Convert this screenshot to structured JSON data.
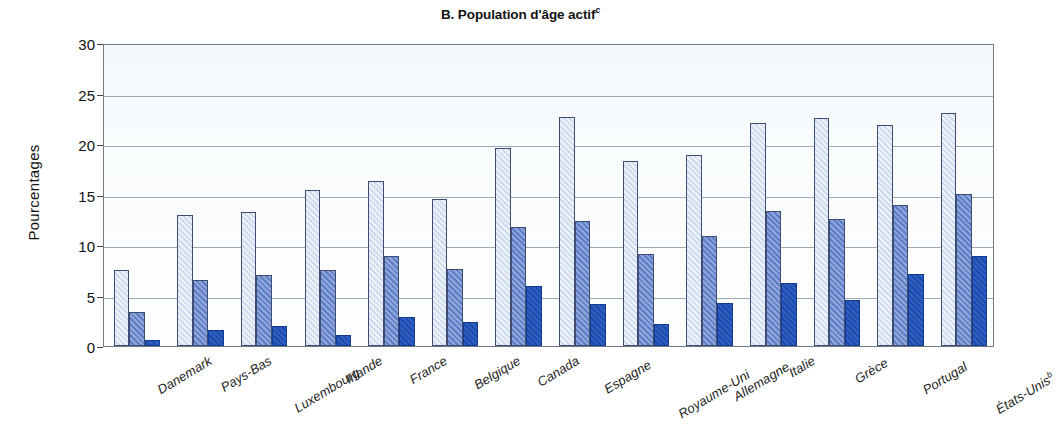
{
  "figure": {
    "panel_label": "B.",
    "title": "B. Population d'âge actif",
    "title_main": "B. Population d'âge actif",
    "title_superscript": "c"
  },
  "axes": {
    "ylabel": "Pourcentages",
    "yticks": [
      "0",
      "5",
      "10",
      "15",
      "20",
      "25",
      "30"
    ],
    "xlabel": ""
  },
  "colors": {
    "series1": "#cfdcf0",
    "series2": "#5f7fc9",
    "series3": "#1b4cb3",
    "frame": "#6e7a84",
    "grid": "#8e9aa3",
    "plot_background": "#fbfdfe"
  },
  "chart_data": {
    "type": "bar",
    "title": "B. Population d'âge actif",
    "xlabel": "",
    "ylabel": "Pourcentages",
    "ylim": [
      0,
      30
    ],
    "ytick_values": [
      0,
      5,
      10,
      15,
      20,
      25,
      30
    ],
    "grid": true,
    "legend": "none",
    "grouped": true,
    "categories": [
      "Danemark",
      "Pays-Bas",
      "Luxembourg",
      "Irlande",
      "France",
      "Belgique",
      "Canada",
      "Espagne",
      "Royaume-Uni",
      "Allemagne",
      "Italie",
      "Grèce",
      "Portugal",
      "États-Unis"
    ],
    "category_superscripts": {
      "États-Unis": "b"
    },
    "series": [
      {
        "name": "series-1",
        "color": "#cfdcf0",
        "values": [
          7.5,
          13.0,
          13.3,
          15.4,
          16.3,
          14.6,
          19.6,
          22.7,
          18.3,
          18.9,
          22.1,
          22.6,
          21.9,
          23.1
        ]
      },
      {
        "name": "series-2",
        "color": "#5f7fc9",
        "values": [
          3.4,
          6.5,
          7.0,
          7.5,
          8.9,
          7.6,
          11.8,
          12.4,
          9.1,
          10.9,
          13.4,
          12.6,
          14.0,
          15.1
        ]
      },
      {
        "name": "series-3",
        "color": "#1b4cb3",
        "values": [
          0.6,
          1.6,
          2.0,
          1.1,
          2.9,
          2.4,
          5.9,
          4.2,
          2.2,
          4.3,
          6.2,
          4.6,
          7.1,
          8.9
        ]
      }
    ]
  }
}
